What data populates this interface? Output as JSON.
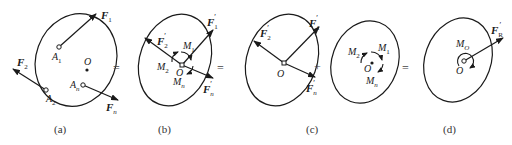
{
  "figure": {
    "panels": [
      {
        "id": "a",
        "caption": "(a)",
        "forces": [
          "F1",
          "F2",
          "Fn"
        ],
        "points": [
          "A1",
          "A2",
          "An",
          "O"
        ],
        "labels": {
          "f1": "F",
          "f1_sub": "1",
          "f2": "F",
          "f2_sub": "2",
          "fn": "F",
          "fn_sub": "n",
          "a1": "A",
          "a1_sub": "1",
          "a2": "A",
          "a2_sub": "2",
          "an": "A",
          "an_sub": "n",
          "o": "O"
        }
      },
      {
        "id": "b",
        "caption": "(b)",
        "labels": {
          "f1": "F",
          "f1_sub": "1",
          "f2": "F",
          "f2_sub": "2",
          "fn": "F",
          "fn_sub": "n",
          "prime": "′",
          "m1": "M",
          "m1_sub": "1",
          "m2": "M",
          "m2_sub": "2",
          "mn": "M",
          "mn_sub": "n",
          "o": "O"
        }
      },
      {
        "id": "c",
        "caption": "(c)",
        "labels": {
          "f1": "F",
          "f1_sub": "1",
          "f2": "F",
          "f2_sub": "2",
          "fn": "F",
          "fn_sub": "n",
          "prime": "′",
          "o": "O",
          "m1": "M",
          "m1_sub": "1",
          "m2": "M",
          "m2_sub": "2",
          "mn": "M",
          "mn_sub": "n",
          "o2": "O"
        }
      },
      {
        "id": "d",
        "caption": "(d)",
        "labels": {
          "fr": "F",
          "fr_sub": "R",
          "prime": "′",
          "mo": "M",
          "mo_sub": "O",
          "o": "O"
        }
      }
    ],
    "operators": [
      "=",
      "=",
      "+",
      "="
    ]
  }
}
